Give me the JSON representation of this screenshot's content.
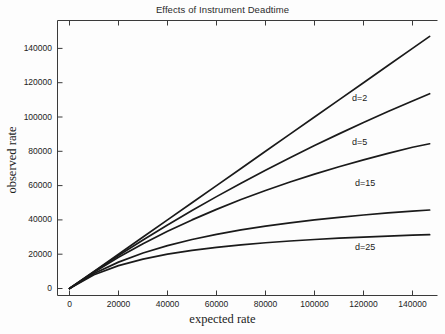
{
  "chart_data": {
    "type": "line",
    "title": "Effects of Instrument Deadtime",
    "xlabel": "expected rate",
    "ylabel": "observed rate",
    "xlim": [
      0,
      150000
    ],
    "ylim": [
      0,
      150000
    ],
    "grid": false,
    "legend": "inline-annotations",
    "xticks": [
      0,
      20000,
      40000,
      60000,
      80000,
      100000,
      120000,
      140000
    ],
    "yticks": [
      0,
      20000,
      40000,
      60000,
      80000,
      100000,
      120000,
      140000
    ],
    "xtick_labels": [
      "0",
      "20000",
      "40000",
      "60000",
      "80000",
      "100000",
      "120000",
      "140000"
    ],
    "ytick_labels": [
      "0",
      "20000",
      "40000",
      "60000",
      "80000",
      "100000",
      "120000",
      "140000"
    ],
    "x": [
      0,
      10000,
      20000,
      30000,
      40000,
      50000,
      60000,
      70000,
      80000,
      90000,
      100000,
      110000,
      120000,
      130000,
      140000,
      147000
    ],
    "series": [
      {
        "name": "d=2",
        "deadtime_us": 2,
        "label": "d=2",
        "label_x": 102000,
        "label_y": 111000,
        "values": [
          0,
          9804,
          19231,
          28302,
          37037,
          45455,
          53571,
          61404,
          68966,
          76271,
          83333,
          90164,
          96774,
          103175,
          109375,
          113580
        ]
      },
      {
        "name": "d=5",
        "deadtime_us": 5,
        "label": "d=5",
        "label_x": 102000,
        "label_y": 85000,
        "values": [
          0,
          9524,
          18182,
          26087,
          33333,
          40000,
          46154,
          51852,
          57143,
          62069,
          66667,
          70968,
          75000,
          78788,
          82353,
          84387
        ]
      },
      {
        "name": "d=15",
        "deadtime_us": 15,
        "label": "d=15",
        "label_x": 104000,
        "label_y": 61000,
        "values": [
          0,
          8696,
          15385,
          20690,
          25000,
          28571,
          31579,
          34146,
          36364,
          38298,
          40000,
          41509,
          42857,
          44068,
          45161,
          45760
        ]
      },
      {
        "name": "d=25",
        "deadtime_us": 25,
        "label": "d=25",
        "label_x": 104000,
        "label_y": 23500,
        "values": [
          0,
          8000,
          13333,
          17143,
          20000,
          22222,
          24000,
          25455,
          26667,
          27692,
          28571,
          29333,
          30000,
          30588,
          31111,
          31394
        ]
      }
    ],
    "curve_pixel_endpoints_note": "five drawn curves; top curve is near-linear reference trending to ~147000",
    "extra_series": [
      {
        "name": "reference",
        "label": "",
        "values": [
          0,
          10000,
          20000,
          30000,
          40000,
          50000,
          60000,
          70000,
          80000,
          90000,
          100000,
          110000,
          120000,
          130000,
          140000,
          147000
        ]
      }
    ]
  },
  "figure": {
    "background_color": "#fdfdfd",
    "line_color": "#1a1a1a",
    "axis_color": "#3a3a3a"
  }
}
